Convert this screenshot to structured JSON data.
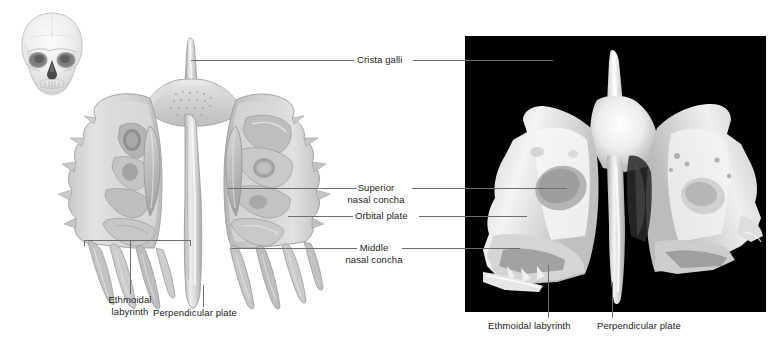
{
  "figure": {
    "background_color": "#ffffff",
    "leader_line_color": "#6e6e6e",
    "label_text_color": "#1b1b1b"
  },
  "inset": {
    "name": "skull-orientation-inset",
    "description": "anterior view of human skull",
    "bone_color": "#e8e8e8"
  },
  "illustration": {
    "name": "ethmoid-bone-illustration",
    "view": "posterior view drawing",
    "bone_color": "#d5d5d5"
  },
  "photograph": {
    "name": "ethmoid-bone-photograph",
    "background_color": "#000000",
    "bone_color": "#efefef"
  },
  "labels": {
    "crista_galli": "Crista galli",
    "superior_nasal_concha_line1": "Superior",
    "superior_nasal_concha_line2": "nasal concha",
    "orbital_plate": "Orbital plate",
    "middle_nasal_concha_line1": "Middle",
    "middle_nasal_concha_line2": "nasal concha",
    "ethmoidal_labyrinth_line1": "Ethmoidal",
    "ethmoidal_labyrinth_line2": "labyrinth",
    "perpendicular_plate": "Perpendicular plate",
    "photo_ethmoidal_labyrinth": "Ethmoidal labyrinth",
    "photo_perpendicular_plate": "Perpendicular plate"
  }
}
